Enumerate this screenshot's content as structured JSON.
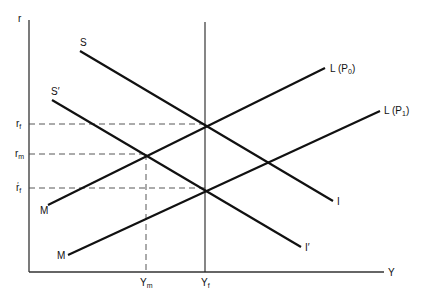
{
  "diagram": {
    "type": "IS-LM style macroeconomic diagram",
    "axes": {
      "y_label": "r",
      "x_label": "Y"
    },
    "y_ticks": [
      {
        "base": "r",
        "sub": "f",
        "prime": "",
        "id": "rf"
      },
      {
        "base": "r",
        "sub": "m",
        "prime": "",
        "id": "rm"
      },
      {
        "base": "r",
        "sub": "f",
        "prime": "′",
        "id": "rf_prime"
      }
    ],
    "x_ticks": [
      {
        "base": "Y",
        "sub": "m",
        "id": "Ym"
      },
      {
        "base": "Y",
        "sub": "f",
        "id": "Yf"
      }
    ],
    "curves": [
      {
        "id": "S-I",
        "start_label": "S",
        "end_label": "I"
      },
      {
        "id": "S'-I'",
        "start_label": "S′",
        "end_label": "I′"
      },
      {
        "id": "M-L(P0)",
        "start_label": "M",
        "end_label_base": "L (P",
        "end_label_sub": "0",
        "end_label_close": ")"
      },
      {
        "id": "M-L(P1)",
        "start_label": "M",
        "end_label_base": "L (P",
        "end_label_sub": "1",
        "end_label_close": ")"
      }
    ],
    "colors": {
      "line": "#111111",
      "axis": "#333333",
      "dashed": "#444444",
      "background": "#ffffff"
    }
  }
}
